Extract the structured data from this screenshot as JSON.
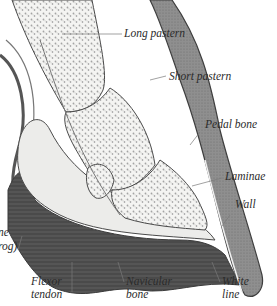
{
  "diagram": {
    "colors": {
      "background": "#ffffff",
      "bone_fill": "#f4f4f2",
      "bone_speckle": "#9a9a9a",
      "outline": "#4a4a4a",
      "wall_fill": "#8c8c8c",
      "sole_dark": "#4f4f4f",
      "frog_light": "#ececea",
      "label_text": "#2b2b2b",
      "leader_line": "#7a7a7a"
    },
    "labels": [
      {
        "id": "long-pastern",
        "lines": [
          "Long pastern"
        ]
      },
      {
        "id": "short-pastern",
        "lines": [
          "Short pastern"
        ]
      },
      {
        "id": "pedal-bone",
        "lines": [
          "Pedal bone"
        ]
      },
      {
        "id": "laminae",
        "lines": [
          "Laminae"
        ]
      },
      {
        "id": "wall",
        "lines": [
          "Wall"
        ]
      },
      {
        "id": "sole-frog-cropped",
        "lines": [
          "ne",
          "rog)"
        ]
      },
      {
        "id": "flexor-tendon",
        "lines": [
          "Flexor",
          "tendon"
        ]
      },
      {
        "id": "navicular-bone",
        "lines": [
          "Navicular",
          "bone"
        ]
      },
      {
        "id": "white-line",
        "lines": [
          "White",
          "line"
        ]
      }
    ]
  }
}
